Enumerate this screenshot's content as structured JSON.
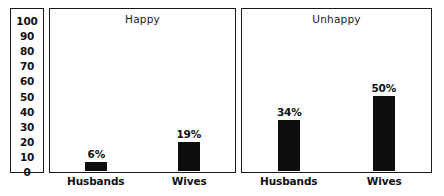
{
  "chart_data": {
    "type": "bar",
    "title": "",
    "xlabel": "",
    "ylabel": "",
    "ylim": [
      0,
      100
    ],
    "yticks": [
      100,
      90,
      80,
      70,
      60,
      50,
      40,
      30,
      20,
      10,
      0
    ],
    "grid": false,
    "legend": "none",
    "categories": [
      "Husbands",
      "Wives"
    ],
    "panels": [
      {
        "title": "Happy",
        "values": [
          6,
          19
        ],
        "labels": [
          "6%",
          "19%"
        ]
      },
      {
        "title": "Unhappy",
        "values": [
          34,
          50
        ],
        "labels": [
          "34%",
          "50%"
        ]
      }
    ],
    "bar_color": "#0d0d0d",
    "frame_color": "#1a1a1a",
    "background": "#ffffff"
  }
}
